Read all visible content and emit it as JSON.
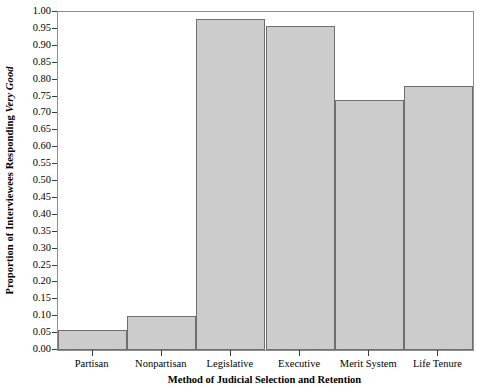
{
  "chart_data": {
    "type": "bar",
    "title": "",
    "categories": [
      "Partisan",
      "Nonpartisan",
      "Legislative",
      "Executive",
      "Merit System",
      "Life Tenure"
    ],
    "values": [
      0.06,
      0.1,
      0.98,
      0.96,
      0.74,
      0.78
    ],
    "series": [
      {
        "name": "Proportion Responding Very Good",
        "values": [
          0.06,
          0.1,
          0.98,
          0.96,
          0.74,
          0.78
        ]
      }
    ],
    "xlabel": "Method of Judicial Selection and Retention",
    "ylabel_plain": "Proportion of Interviewees Responding Very Good",
    "ylabel_prefix": "Proportion of Interviewees Responding ",
    "ylabel_italic": "Very Good",
    "ylim": [
      0.0,
      1.0
    ],
    "ytick_values": [
      0.0,
      0.05,
      0.1,
      0.15,
      0.2,
      0.25,
      0.3,
      0.35,
      0.4,
      0.45,
      0.5,
      0.55,
      0.6,
      0.65,
      0.7,
      0.75,
      0.8,
      0.85,
      0.9,
      0.95,
      1.0
    ],
    "ytick_labels": [
      "0.00",
      "0.05",
      "0.10",
      "0.15",
      "0.20",
      "0.25",
      "0.30",
      "0.35",
      "0.40",
      "0.45",
      "0.50",
      "0.55",
      "0.60",
      "0.65",
      "0.70",
      "0.75",
      "0.80",
      "0.85",
      "0.90",
      "0.95",
      "1.00"
    ],
    "grid": false,
    "legend": "none",
    "bar_fill_color": "#cccccc",
    "bar_border_color": "#6f6f6f",
    "axis_color": "#8d8d8d",
    "background_color": "#ffffff"
  }
}
